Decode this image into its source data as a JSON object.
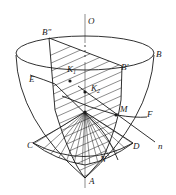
{
  "diagram": {
    "labels": {
      "O": "O",
      "B_double_prime": "B\"",
      "B": "B",
      "B_prime": "B'",
      "E": "E",
      "K1": "K",
      "K1_sub": "1",
      "K2": "K",
      "K2_sub": "2",
      "M": "M",
      "F": "F",
      "n": "n",
      "C": "C",
      "D": "D",
      "N": "N",
      "A": "A"
    },
    "colors": {
      "stroke": "#1a1a1a",
      "background": "#ffffff"
    }
  }
}
